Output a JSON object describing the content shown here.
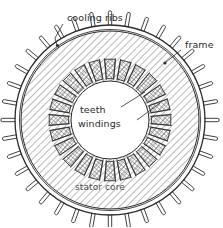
{
  "figure": {
    "background_color": "#ffffff",
    "ink_color": "#2b2b2b",
    "labels": {
      "cooling_ribs": "cooling ribs",
      "frame": "frame",
      "teeth": "teeth",
      "windings": "windings",
      "stator_core": "stator core"
    },
    "geometry": {
      "center_x": 110,
      "center_y": 120,
      "frame_outer_radius": 95,
      "frame_inner_radius": 90,
      "core_outer_radius": 89,
      "core_inner_radius": 40,
      "bore_radius": 39,
      "rib_count": 36,
      "rib_length": 13,
      "winding_count": 24,
      "winding_ring_radius": 52,
      "core_hatch_angle_deg": 45,
      "winding_hatch": "cross-hatch"
    }
  },
  "chart_data": {
    "type": "diagram",
    "annotations": [
      {
        "label": "cooling ribs",
        "target": "radial fins on frame outer surface"
      },
      {
        "label": "frame",
        "target": "outer ring"
      },
      {
        "label": "teeth",
        "target": "core projections between slots"
      },
      {
        "label": "windings",
        "target": "cross-hatched coil sections in slots"
      },
      {
        "label": "stator core",
        "target": "hatched annulus"
      }
    ]
  }
}
